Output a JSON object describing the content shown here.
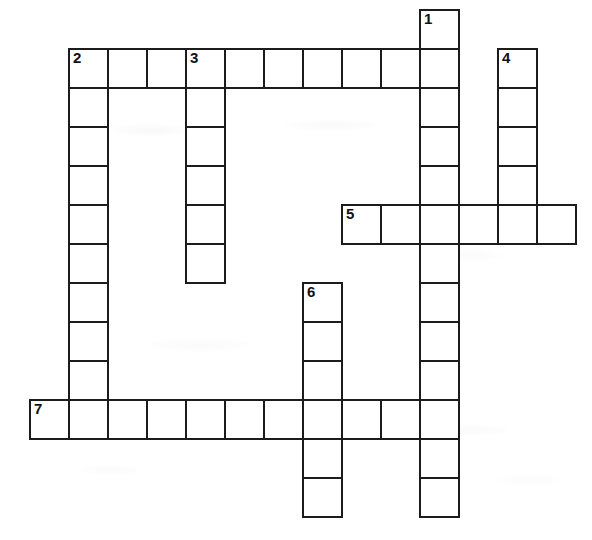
{
  "puzzle": {
    "kind": "crossword-grid",
    "title": "Crossword Puzzle Grid",
    "cell_size_px": 39,
    "origin_x_px": 68,
    "origin_y_px": 9,
    "border_color": "#1c1c1c",
    "cell_fill_color": "#ffffff",
    "background_color": "#ffffff",
    "number_color": "#111111",
    "entries": [
      {
        "number": "1",
        "direction": "down",
        "start_col": 9,
        "start_row": 0,
        "length": 13
      },
      {
        "number": "2",
        "direction": "across",
        "start_col": 0,
        "start_row": 1,
        "length": 10
      },
      {
        "number": "2",
        "direction": "down",
        "start_col": 0,
        "start_row": 1,
        "length": 10
      },
      {
        "number": "3",
        "direction": "down",
        "start_col": 3,
        "start_row": 1,
        "length": 6
      },
      {
        "number": "4",
        "direction": "down",
        "start_col": 11,
        "start_row": 1,
        "length": 4
      },
      {
        "number": "5",
        "direction": "across",
        "start_col": 7,
        "start_row": 5,
        "length": 6
      },
      {
        "number": "6",
        "direction": "down",
        "start_col": 6,
        "start_row": 7,
        "length": 6
      },
      {
        "number": "7",
        "direction": "across",
        "start_col": -1,
        "start_row": 10,
        "length": 10
      }
    ],
    "numbered_cells": [
      {
        "number": "1",
        "col": 9,
        "row": 0
      },
      {
        "number": "2",
        "col": 0,
        "row": 1
      },
      {
        "number": "3",
        "col": 3,
        "row": 1
      },
      {
        "number": "4",
        "col": 11,
        "row": 1
      },
      {
        "number": "5",
        "col": 7,
        "row": 5
      },
      {
        "number": "6",
        "col": 6,
        "row": 7
      },
      {
        "number": "7",
        "col": -1,
        "row": 10
      }
    ],
    "letters": {}
  }
}
